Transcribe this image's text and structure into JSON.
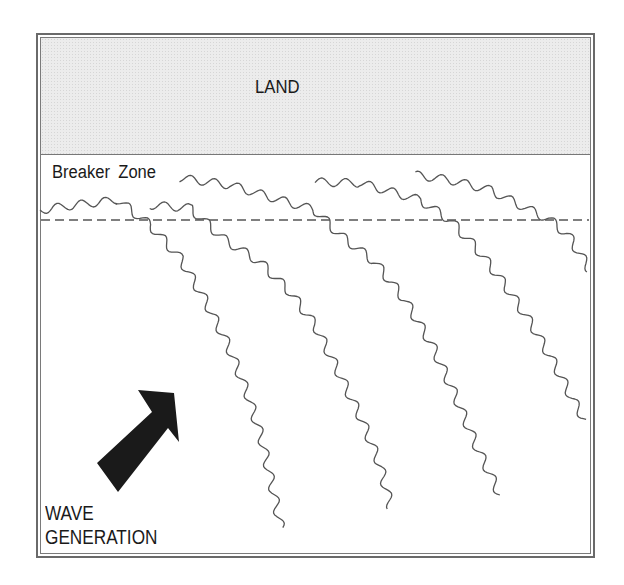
{
  "diagram": {
    "labels": {
      "land": "LAND",
      "breaker_zone": "Breaker  Zone",
      "wave_generation_line1": "WAVE",
      "wave_generation_line2": "GENERATION"
    },
    "colors": {
      "land_fill": "#ececec",
      "frame": "#6a6a6a",
      "wave_line": "#555555",
      "dashed_line": "#555555",
      "arrow": "#1a1a1a"
    },
    "breaker_line": {
      "y": 220,
      "x1": 41,
      "x2": 589,
      "dash": "9 5"
    },
    "arrow": {
      "direction": "north-east",
      "points": [
        [
          97,
          463
        ],
        [
          152,
          412
        ],
        [
          138,
          390
        ],
        [
          174,
          393
        ],
        [
          179,
          442
        ],
        [
          168,
          428
        ],
        [
          118,
          492
        ]
      ]
    },
    "waves": [
      {
        "id": "crest-1",
        "points": [
          [
            40,
            210
          ],
          [
            75,
            205
          ],
          [
            118,
            200
          ],
          [
            150,
            225
          ],
          [
            180,
            258
          ],
          [
            205,
            300
          ],
          [
            228,
            345
          ],
          [
            248,
            395
          ],
          [
            262,
            440
          ],
          [
            272,
            485
          ],
          [
            281,
            528
          ]
        ]
      },
      {
        "id": "crest-2",
        "points": [
          [
            150,
            205
          ],
          [
            190,
            208
          ],
          [
            225,
            240
          ],
          [
            260,
            262
          ],
          [
            290,
            292
          ],
          [
            315,
            325
          ],
          [
            340,
            375
          ],
          [
            362,
            420
          ],
          [
            380,
            465
          ],
          [
            391,
            508
          ]
        ]
      },
      {
        "id": "crest-3",
        "points": [
          [
            180,
            178
          ],
          [
            230,
            185
          ],
          [
            280,
            200
          ],
          [
            315,
            210
          ],
          [
            340,
            235
          ],
          [
            375,
            262
          ],
          [
            405,
            300
          ],
          [
            432,
            345
          ],
          [
            455,
            395
          ],
          [
            476,
            445
          ],
          [
            500,
            495
          ]
        ]
      },
      {
        "id": "crest-4",
        "points": [
          [
            315,
            182
          ],
          [
            360,
            183
          ],
          [
            385,
            190
          ],
          [
            420,
            200
          ],
          [
            450,
            220
          ],
          [
            478,
            250
          ],
          [
            505,
            285
          ],
          [
            532,
            325
          ],
          [
            555,
            365
          ],
          [
            573,
            400
          ],
          [
            585,
            420
          ]
        ]
      },
      {
        "id": "crest-5",
        "points": [
          [
            415,
            175
          ],
          [
            450,
            180
          ],
          [
            490,
            190
          ],
          [
            520,
            205
          ],
          [
            550,
            220
          ],
          [
            568,
            235
          ],
          [
            590,
            270
          ]
        ]
      }
    ]
  }
}
